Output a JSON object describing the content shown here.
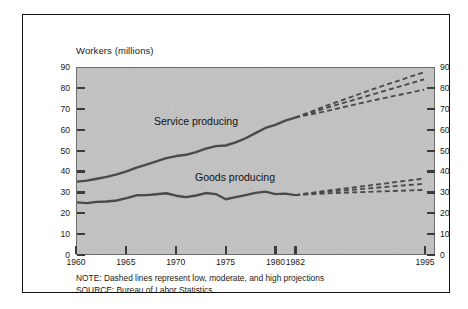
{
  "chart_data": {
    "type": "line",
    "title": "Workers (millions)",
    "xlabel": "",
    "ylabel": "Workers (millions)",
    "ylim": [
      0,
      90
    ],
    "ytick_values": [
      0,
      10,
      20,
      30,
      40,
      50,
      60,
      70,
      80,
      90
    ],
    "xlim": [
      1960,
      1996
    ],
    "xtick_labels": [
      "1960",
      "1965",
      "1970",
      "1975",
      "1980",
      "1982",
      "1995"
    ],
    "xtick_values": [
      1960,
      1965,
      1970,
      1975,
      1980,
      1982,
      1995
    ],
    "grid": false,
    "legend_position": "inline-annotations",
    "dual_y_axis": true,
    "projection_start_year": 1982,
    "series": [
      {
        "name": "Service producing",
        "style": "solid",
        "x": [
          1960,
          1961,
          1962,
          1963,
          1964,
          1965,
          1966,
          1967,
          1968,
          1969,
          1970,
          1971,
          1972,
          1973,
          1974,
          1975,
          1976,
          1977,
          1978,
          1979,
          1980,
          1981,
          1982
        ],
        "values": [
          35.0,
          35.5,
          36.4,
          37.3,
          38.5,
          40.0,
          41.8,
          43.3,
          44.8,
          46.4,
          47.4,
          48.0,
          49.3,
          51.0,
          52.2,
          52.5,
          54.0,
          56.0,
          58.5,
          61.0,
          62.5,
          64.5,
          66.0
        ]
      },
      {
        "name": "Goods producing",
        "style": "solid",
        "x": [
          1960,
          1961,
          1962,
          1963,
          1964,
          1965,
          1966,
          1967,
          1968,
          1969,
          1970,
          1971,
          1972,
          1973,
          1974,
          1975,
          1976,
          1977,
          1978,
          1979,
          1980,
          1981,
          1982
        ],
        "values": [
          25.0,
          24.6,
          25.2,
          25.4,
          25.9,
          27.0,
          28.4,
          28.5,
          28.9,
          29.4,
          28.2,
          27.5,
          28.3,
          29.5,
          29.0,
          26.5,
          27.5,
          28.5,
          29.6,
          30.2,
          29.0,
          29.2,
          28.5
        ]
      },
      {
        "name": "Service producing - high projection",
        "style": "dashed",
        "x": [
          1982,
          1985,
          1990,
          1995
        ],
        "values": [
          66.0,
          71.5,
          80.0,
          88.0
        ]
      },
      {
        "name": "Service producing - moderate projection",
        "style": "dashed",
        "x": [
          1982,
          1985,
          1990,
          1995
        ],
        "values": [
          66.0,
          70.5,
          77.5,
          84.5
        ]
      },
      {
        "name": "Service producing - low projection",
        "style": "dashed",
        "x": [
          1982,
          1985,
          1990,
          1995
        ],
        "values": [
          66.0,
          69.0,
          74.5,
          79.5
        ]
      },
      {
        "name": "Goods producing - high projection",
        "style": "dashed",
        "x": [
          1982,
          1985,
          1990,
          1995
        ],
        "values": [
          28.5,
          30.5,
          33.5,
          36.5
        ]
      },
      {
        "name": "Goods producing - moderate projection",
        "style": "dashed",
        "x": [
          1982,
          1985,
          1990,
          1995
        ],
        "values": [
          28.5,
          30.0,
          32.0,
          34.0
        ]
      },
      {
        "name": "Goods producing - low projection",
        "style": "dashed",
        "x": [
          1982,
          1985,
          1990,
          1995
        ],
        "values": [
          28.5,
          29.3,
          30.2,
          31.0
        ]
      }
    ],
    "annotations": [
      {
        "text": "Service producing",
        "x": 1968,
        "y": 55
      },
      {
        "text": "Goods producing",
        "x": 1974,
        "y": 38
      }
    ],
    "footnotes": [
      "NOTE: Dashed lines represent low, moderate, and high projections",
      "SOURCE: Bureau of Labor Statistics"
    ]
  },
  "colors": {
    "plot_background": "#c2c2c2",
    "line": "#4a4a4a",
    "frame": "#111111",
    "text": "#1a1a1a"
  }
}
